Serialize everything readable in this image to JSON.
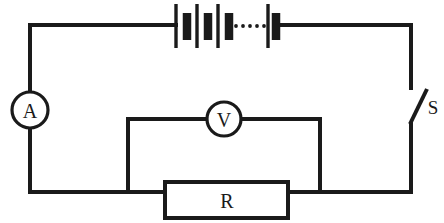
{
  "diagram": {
    "stroke_color": "#1a1a1a",
    "background_color": "#ffffff",
    "components": {
      "ammeter": {
        "label": "A",
        "name": "ammeter",
        "shape": "circle",
        "center": [
          30,
          110
        ],
        "radius": 18
      },
      "voltmeter": {
        "label": "V",
        "name": "voltmeter",
        "shape": "circle",
        "center": [
          224,
          119
        ],
        "radius": 17
      },
      "resistor": {
        "label": "R",
        "name": "resistor",
        "shape": "rectangle",
        "bounds": [
          165,
          182,
          123,
          36
        ]
      },
      "switch": {
        "label": "S",
        "name": "switch",
        "state": "open",
        "label_position": [
          432,
          106
        ]
      },
      "battery": {
        "name": "battery-pack",
        "cell_count_shown": 4,
        "has_ellipsis": true,
        "ellipsis_dots": 6,
        "span_x": [
          175,
          275
        ],
        "baseline_y": 25
      }
    },
    "loop": {
      "top_left": [
        30,
        25
      ],
      "top_right": [
        411,
        25
      ],
      "bottom_left": [
        31,
        192
      ],
      "bottom_right": [
        411,
        192
      ]
    }
  }
}
